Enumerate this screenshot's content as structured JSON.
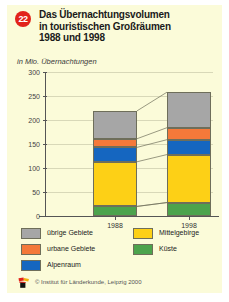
{
  "badge": "22",
  "title": {
    "line1": "Das Übernachtungsvolumen",
    "line2": "in touristischen Großräumen",
    "line3": "1988 und 1998"
  },
  "subtitle": "in Mio. Übernachtungen",
  "footer": {
    "credit": "© Institut für Länderkunde, Leipzig 2000",
    "logo_name": "institut-fuer-laenderkunde-logo"
  },
  "colors": {
    "uebrige_gebiete": "#a6a6a6",
    "urbane_gebiete": "#f4793a",
    "alpenraum": "#1566c0",
    "mittelgebirge": "#fdd016",
    "kueste": "#4ca34c",
    "background": "#fbfbd9",
    "badge_red": "#e2231a",
    "grid": "#d8d8b8",
    "axis": "#555555"
  },
  "legend": {
    "column_left": [
      {
        "label": "übrige Gebiete",
        "color": "#a6a6a6",
        "key": "uebrige_gebiete"
      },
      {
        "label": "urbane Gebiete",
        "color": "#f4793a",
        "key": "urbane_gebiete"
      },
      {
        "label": "Alpenraum",
        "color": "#1566c0",
        "key": "alpenraum"
      }
    ],
    "column_right": [
      {
        "label": "Mittelgebirge",
        "color": "#fdd016",
        "key": "mittelgebirge"
      },
      {
        "label": "Küste",
        "color": "#4ca34c",
        "key": "kueste"
      }
    ]
  },
  "chart_data": {
    "type": "bar",
    "stacked": true,
    "title": "Das Übernachtungsvolumen in touristischen Großräumen 1988 und 1998",
    "subtitle": "in Mio. Übernachtungen",
    "xlabel": "",
    "ylabel": "in Mio. Übernachtungen",
    "categories": [
      "1988",
      "1998"
    ],
    "ylim": [
      0,
      300
    ],
    "yticks": [
      0,
      50,
      100,
      150,
      200,
      250,
      300
    ],
    "ytick_labels": [
      "0",
      "50",
      "100",
      "150",
      "200",
      "250",
      "300"
    ],
    "grid": true,
    "legend_position": "bottom",
    "series": [
      {
        "name": "Küste",
        "color": "#4ca34c",
        "values": [
          20,
          28
        ]
      },
      {
        "name": "Mittelgebirge",
        "color": "#fdd016",
        "values": [
          93,
          100
        ]
      },
      {
        "name": "Alpenraum",
        "color": "#1566c0",
        "values": [
          30,
          31
        ]
      },
      {
        "name": "urbane Gebiete",
        "color": "#f4793a",
        "values": [
          18,
          25
        ]
      },
      {
        "name": "übrige Gebiete",
        "color": "#a6a6a6",
        "values": [
          58,
          74
        ]
      }
    ],
    "totals": [
      219,
      258
    ]
  }
}
